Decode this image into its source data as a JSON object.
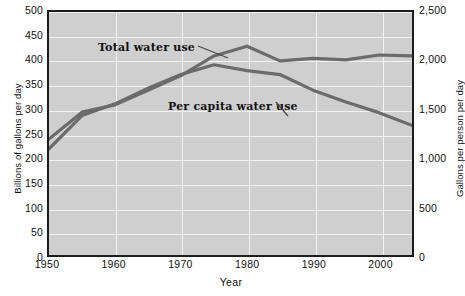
{
  "chart_data": {
    "type": "line",
    "title": "",
    "xlabel": "Year",
    "ylabel": "Billions of gallons per day",
    "ylabel_right": "Gallons per person per day",
    "xlim": [
      1950,
      2005
    ],
    "ylim": [
      0,
      500
    ],
    "ylim_right": [
      0,
      2500
    ],
    "grid": true,
    "legend_position": "inline-annotations",
    "plot_background": "#cfcfcf",
    "gridline_color": "#f2f2f2",
    "line_color": "#6b6b6b",
    "x_ticks": [
      "1950",
      "1960",
      "1970",
      "1980",
      "1990",
      "2000"
    ],
    "x_tick_values": [
      1950,
      1960,
      1970,
      1980,
      1990,
      2000
    ],
    "y_ticks_left": [
      "0",
      "50",
      "100",
      "150",
      "200",
      "250",
      "300",
      "350",
      "400",
      "450",
      "500"
    ],
    "y_tick_values_left": [
      0,
      50,
      100,
      150,
      200,
      250,
      300,
      350,
      400,
      450,
      500
    ],
    "y_ticks_right": [
      "0",
      "500",
      "1,000",
      "1,500",
      "2,000",
      "2,500"
    ],
    "y_tick_values_right": [
      0,
      500,
      1000,
      1500,
      2000,
      2500
    ],
    "x": [
      1950,
      1955,
      1960,
      1965,
      1970,
      1975,
      1980,
      1985,
      1990,
      1995,
      2000,
      2005
    ],
    "series": [
      {
        "name": "Total water use",
        "axis": "left",
        "units": "billions of gallons per day",
        "values": [
          240,
          295,
          310,
          340,
          370,
          410,
          430,
          400,
          405,
          402,
          412,
          410
        ]
      },
      {
        "name": "Per capita water use",
        "axis": "right",
        "units": "gallons per person per day",
        "values": [
          1100,
          1440,
          1560,
          1720,
          1860,
          1960,
          1900,
          1860,
          1700,
          1580,
          1470,
          1340
        ]
      }
    ],
    "annotations": [
      {
        "text": "Total water use",
        "x": 1963,
        "y": 455
      },
      {
        "text": "Per capita water use",
        "x": 1973,
        "y": 335
      }
    ]
  }
}
